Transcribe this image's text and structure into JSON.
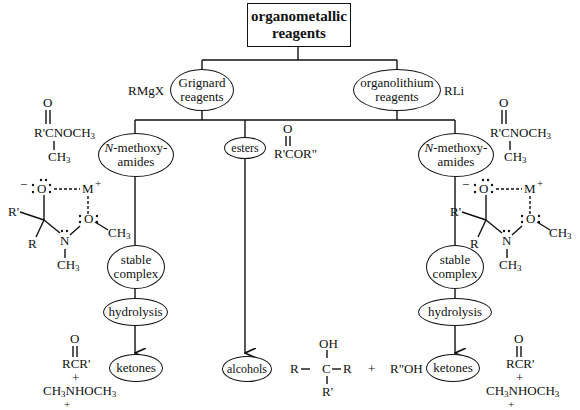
{
  "title": {
    "line1": "organometallic",
    "line2": "reagents"
  },
  "reagents": {
    "grignard": {
      "line1": "Grignard",
      "line2": "reagents",
      "formula": "RMgX"
    },
    "organolithium": {
      "line1": "organolithium",
      "line2": "reagents",
      "formula": "RLi"
    }
  },
  "substrates": {
    "left_amide": {
      "prefix": "N",
      "line1_rest": "-methoxy-",
      "line2": "amides"
    },
    "esters": {
      "label": "esters",
      "formula_top": "O",
      "formula": "R'COR\""
    },
    "right_amide": {
      "prefix": "N",
      "line1_rest": "-methoxy-",
      "line2": "amides"
    }
  },
  "amide_structure": {
    "o_top": "O",
    "main": "R'CNOCH",
    "sub": "3",
    "ch3": "CH",
    "ch3_sub": "3"
  },
  "complex_structure": {
    "o_anion": "O",
    "minus": "−",
    "metal": "M",
    "plus": "+",
    "r_prime": "R'",
    "r": "R",
    "n": "N",
    "o2": "O",
    "och3": "CH",
    "och3_sub": "3",
    "nch3": "CH",
    "nch3_sub": "3"
  },
  "steps": {
    "stable_complex": {
      "line1": "stable",
      "line2": "complex"
    },
    "hydrolysis": "hydrolysis",
    "ketones": "ketones",
    "alcohols": "alcohols"
  },
  "ketone_products": {
    "o_top": "O",
    "formula": "RCR'",
    "plus1": "+",
    "amine_a": "CH",
    "amine_a_sub": "3",
    "amine_b": "NHOCH",
    "amine_b_sub": "3",
    "plus2": "+"
  },
  "alcohol_products": {
    "oh": "OH",
    "left_r": "R",
    "carbon": "C",
    "right_r": "R",
    "bottom_r": "R'",
    "plus": "+",
    "byproduct": "R\"OH"
  }
}
